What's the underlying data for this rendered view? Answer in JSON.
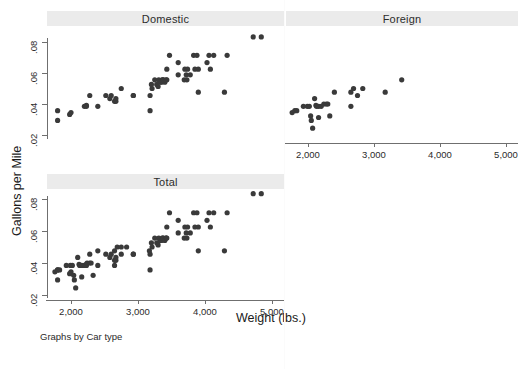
{
  "figure": {
    "note": "Graphs by Car type",
    "bottom_partial_text": "",
    "marker_color": "#3a3a3a",
    "band_color": "#ebebeb",
    "axis_color": "#6f6f6f",
    "background": "#ffffff"
  },
  "chart_data": {
    "type": "scatter",
    "title": "",
    "xlabel": "Weight (lbs.)",
    "ylabel": "Gallons per Mile",
    "xlim": [
      1600,
      5100
    ],
    "ylim": [
      0.015,
      0.088
    ],
    "xticks": [
      2000,
      3000,
      4000,
      5000
    ],
    "xticklabels": [
      "2,000",
      "3,000",
      "4,000",
      "5,000"
    ],
    "yticks": [
      0.02,
      0.04,
      0.06,
      0.08
    ],
    "yticklabels": [
      ".02",
      ".04",
      ".06",
      ".08"
    ],
    "grid": false,
    "legend": "none",
    "panel_by": "Car type",
    "panels": [
      {
        "label": "Domestic",
        "row": 0,
        "col": 0,
        "has_xaxis": false,
        "has_yaxis": true,
        "x": [
          1800,
          1800,
          1980,
          2000,
          2200,
          2230,
          2230,
          2280,
          2400,
          2520,
          2580,
          2600,
          2650,
          2670,
          2670,
          2750,
          2930,
          2930,
          3180,
          3180,
          3200,
          3210,
          3250,
          3280,
          3300,
          3310,
          3330,
          3350,
          3360,
          3370,
          3380,
          3400,
          3420,
          3430,
          3430,
          3470,
          3600,
          3600,
          3690,
          3700,
          3720,
          3730,
          3740,
          3780,
          3830,
          3850,
          3880,
          3900,
          3900,
          4030,
          4060,
          4080,
          4130,
          4290,
          4330,
          4720,
          4840
        ],
        "y": [
          0.0357,
          0.0294,
          0.0333,
          0.0345,
          0.0385,
          0.0392,
          0.0385,
          0.0455,
          0.0385,
          0.0455,
          0.0435,
          0.0455,
          0.0417,
          0.0417,
          0.0435,
          0.05,
          0.0455,
          0.0455,
          0.0455,
          0.0357,
          0.0526,
          0.05,
          0.0556,
          0.0526,
          0.0513,
          0.0556,
          0.0541,
          0.0541,
          0.0556,
          0.0556,
          0.0556,
          0.0541,
          0.0556,
          0.0556,
          0.0625,
          0.0714,
          0.0667,
          0.0588,
          0.0556,
          0.0625,
          0.0588,
          0.0556,
          0.0625,
          0.0588,
          0.0714,
          0.0625,
          0.0714,
          0.0625,
          0.0476,
          0.0667,
          0.0714,
          0.0625,
          0.0714,
          0.0476,
          0.0714,
          0.0833,
          0.0833
        ]
      },
      {
        "label": "Foreign",
        "row": 0,
        "col": 1,
        "has_xaxis": true,
        "has_yaxis": false,
        "x": [
          1760,
          1800,
          1830,
          1930,
          1990,
          2020,
          2040,
          2050,
          2070,
          2100,
          2120,
          2130,
          2160,
          2160,
          2200,
          2240,
          2280,
          2300,
          2330,
          2400,
          2650,
          2650,
          2690,
          2750,
          2830,
          3170,
          3420
        ],
        "y": [
          0.0345,
          0.0357,
          0.0357,
          0.0385,
          0.0385,
          0.0385,
          0.0323,
          0.0294,
          0.0244,
          0.0435,
          0.0392,
          0.0385,
          0.0385,
          0.0313,
          0.0385,
          0.04,
          0.04,
          0.04,
          0.0323,
          0.0476,
          0.0476,
          0.0385,
          0.05,
          0.0455,
          0.05,
          0.0476,
          0.0556
        ]
      },
      {
        "label": "Total",
        "row": 1,
        "col": 0,
        "has_xaxis": true,
        "has_yaxis": true,
        "x": [
          1760,
          1800,
          1800,
          1800,
          1830,
          1930,
          1980,
          1990,
          2000,
          2020,
          2040,
          2050,
          2070,
          2100,
          2120,
          2130,
          2160,
          2160,
          2200,
          2200,
          2230,
          2230,
          2240,
          2280,
          2280,
          2300,
          2330,
          2400,
          2400,
          2520,
          2580,
          2600,
          2650,
          2650,
          2650,
          2670,
          2670,
          2690,
          2750,
          2750,
          2830,
          2930,
          2930,
          3170,
          3180,
          3180,
          3200,
          3210,
          3250,
          3280,
          3300,
          3310,
          3330,
          3350,
          3360,
          3370,
          3380,
          3400,
          3420,
          3420,
          3430,
          3430,
          3470,
          3600,
          3600,
          3690,
          3700,
          3720,
          3730,
          3740,
          3780,
          3830,
          3850,
          3880,
          3900,
          3900,
          4030,
          4060,
          4080,
          4130,
          4290,
          4330,
          4720,
          4840
        ],
        "y": [
          0.0345,
          0.0357,
          0.0357,
          0.0294,
          0.0357,
          0.0385,
          0.0333,
          0.0385,
          0.0345,
          0.0385,
          0.0323,
          0.0294,
          0.0244,
          0.0435,
          0.0392,
          0.0385,
          0.0385,
          0.0313,
          0.0385,
          0.0385,
          0.0392,
          0.0385,
          0.04,
          0.0455,
          0.04,
          0.04,
          0.0323,
          0.0385,
          0.0476,
          0.0455,
          0.0435,
          0.0455,
          0.0417,
          0.0476,
          0.0385,
          0.0417,
          0.0435,
          0.05,
          0.05,
          0.0455,
          0.05,
          0.0455,
          0.0455,
          0.0476,
          0.0455,
          0.0357,
          0.0526,
          0.05,
          0.0556,
          0.0526,
          0.0513,
          0.0556,
          0.0541,
          0.0541,
          0.0556,
          0.0556,
          0.0556,
          0.0541,
          0.0556,
          0.0556,
          0.0556,
          0.0625,
          0.0714,
          0.0667,
          0.0588,
          0.0556,
          0.0625,
          0.0588,
          0.0556,
          0.0625,
          0.0588,
          0.0714,
          0.0625,
          0.0714,
          0.0625,
          0.0476,
          0.0667,
          0.0714,
          0.0625,
          0.0714,
          0.0476,
          0.0714,
          0.0833,
          0.0833
        ]
      }
    ]
  }
}
